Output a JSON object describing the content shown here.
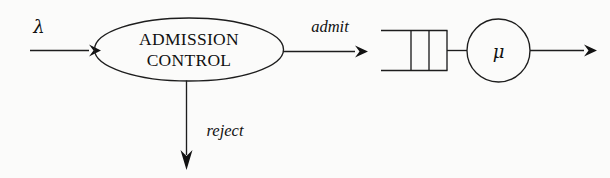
{
  "diagram": {
    "background_color": "#fbfbfa",
    "stroke_color": "#1d1d1d",
    "nodes": {
      "admission_control": {
        "label_line1": "ADMISSION",
        "label_line2": "CONTROL",
        "shape": "ellipse"
      },
      "queue": {
        "shape": "open-box",
        "slots": 3
      },
      "server": {
        "label": "μ",
        "shape": "circle"
      }
    },
    "edges": {
      "arrival": {
        "label": "λ"
      },
      "admit": {
        "label": "admit"
      },
      "reject": {
        "label": "reject"
      },
      "departure": {
        "label": ""
      }
    }
  }
}
